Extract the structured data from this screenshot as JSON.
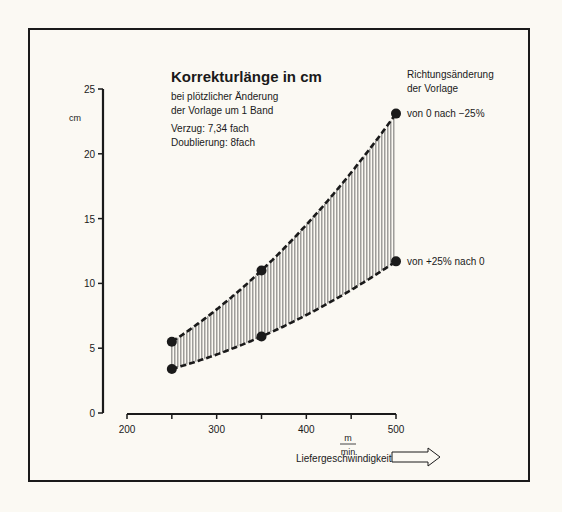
{
  "chart_data": {
    "type": "area",
    "title": "Korrekturlänge in cm",
    "subtitle": [
      "bei plötzlicher Änderung",
      "der Vorlage um 1 Band"
    ],
    "notes": [
      "Verzug: 7,34 fach",
      "Doublierung: 8fach"
    ],
    "legend_title": [
      "Richtungsänderung",
      "der Vorlage"
    ],
    "ylabel": "cm",
    "xlabel": "Liefergeschwindigkeit",
    "xunit_num": "m",
    "xunit_den": "min",
    "ylim": [
      0,
      25
    ],
    "xlim": [
      200,
      500
    ],
    "yticks": [
      0,
      5,
      10,
      15,
      20,
      25
    ],
    "xticks": [
      200,
      250,
      300,
      350,
      400,
      450,
      500
    ],
    "xtick_labels": [
      {
        "value": 200,
        "label": "200"
      },
      {
        "value": 300,
        "label": "300"
      },
      {
        "value": 400,
        "label": "400"
      },
      {
        "value": 500,
        "label": "500"
      }
    ],
    "grid": false,
    "series": [
      {
        "name": "von 0 nach −25%",
        "x": [
          250,
          350,
          500
        ],
        "values": [
          5.5,
          11.0,
          23.1
        ]
      },
      {
        "name": "von +25% nach 0",
        "x": [
          250,
          350,
          500
        ],
        "values": [
          3.4,
          5.9,
          11.7
        ]
      }
    ],
    "fill_between": "vertical-hatch"
  }
}
